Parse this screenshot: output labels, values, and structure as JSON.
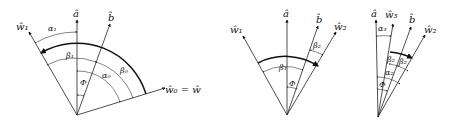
{
  "panels": [
    {
      "id": "panel-1",
      "vectors": {
        "a": "â",
        "b": "b̂",
        "w1": "ŵ₁",
        "w0": "ŵ₀ = ŵ"
      },
      "angles": {
        "alpha1": "α₁",
        "beta1": "β₁",
        "alpha0": "α₀",
        "beta0": "β₀",
        "phi": "Φ"
      }
    },
    {
      "id": "panel-2",
      "vectors": {
        "w1": "ŵ₁",
        "a": "â",
        "b": "b̂",
        "w2": "ŵ₂"
      },
      "angles": {
        "beta1": "β₁",
        "beta2": "β₂",
        "phi": "Φ"
      }
    },
    {
      "id": "panel-3",
      "vectors": {
        "a": "â",
        "w3": "ŵ₃",
        "b": "b̂",
        "w2": "ŵ₂"
      },
      "angles": {
        "alpha3": "α₃",
        "beta2a": "β₂",
        "beta2b": "β₂",
        "alpha2": "α₂",
        "phi": "Φ"
      }
    }
  ]
}
